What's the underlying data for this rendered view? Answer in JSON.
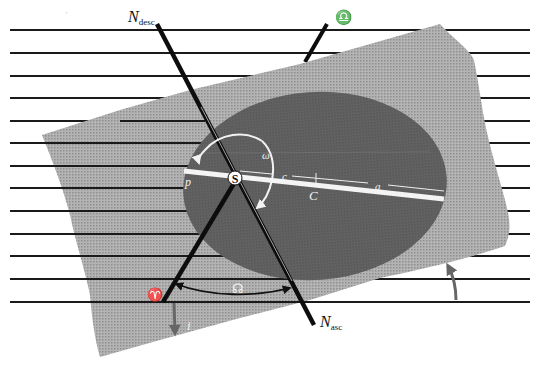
{
  "diagram": {
    "type": "orbital-elements",
    "colors": {
      "background": "#ffffff",
      "reference_lines": "#1a1a1a",
      "orbital_plane": "#a8a8a8",
      "orbit_ellipse": "#5e5e5e",
      "major_axis": "#f4f4f4",
      "node_line": "#0d0d0d",
      "inclination_arrow": "#6a6a6a"
    },
    "labels": {
      "node_desc_main": "N",
      "node_desc_sub": "desc",
      "node_asc_main": "N",
      "node_asc_sub": "asc",
      "libra_symbol": "♎",
      "aries_symbol": "♈",
      "longitude_ascending_node": "☊",
      "argument_of_perihelion": "ω",
      "perihelion": "p",
      "sun": "S",
      "focal_distance": "c",
      "center": "C",
      "semi_major_axis": "a",
      "inclination": "i"
    },
    "reference_line_count": 13
  }
}
